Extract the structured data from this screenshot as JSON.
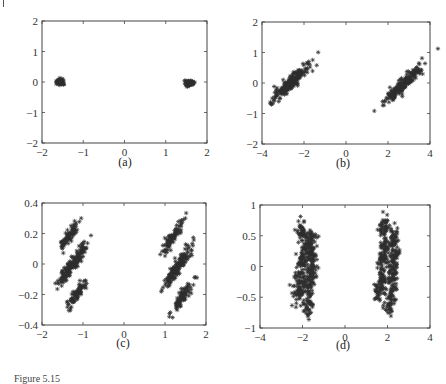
{
  "figure": {
    "caption_fragment": "Figure 5.15",
    "marker_color": "#2e2e2e",
    "panels": [
      {
        "id": "a",
        "label": "(a)",
        "frame": {
          "left": 42,
          "top": 21,
          "right": 207,
          "bottom": 143
        },
        "label_pos": {
          "x": 125,
          "y": 163
        }
      },
      {
        "id": "b",
        "label": "(b)",
        "frame": {
          "left": 262,
          "top": 22,
          "right": 430,
          "bottom": 144
        },
        "label_pos": {
          "x": 343,
          "y": 164
        }
      },
      {
        "id": "c",
        "label": "(c)",
        "frame": {
          "left": 42,
          "top": 203,
          "right": 206,
          "bottom": 325
        },
        "label_pos": {
          "x": 123,
          "y": 344
        }
      },
      {
        "id": "d",
        "label": "(d)",
        "frame": {
          "left": 260,
          "top": 205,
          "right": 430,
          "bottom": 328
        },
        "label_pos": {
          "x": 343,
          "y": 346
        }
      }
    ]
  },
  "chart_data": [
    {
      "panel": "a",
      "type": "scatter",
      "title": "",
      "xlabel": "",
      "ylabel": "",
      "xlim": [
        -2,
        2
      ],
      "ylim": [
        -2,
        2
      ],
      "xticks": [
        -2,
        -1,
        0,
        1,
        2
      ],
      "yticks": [
        -2,
        -1,
        0,
        1,
        2
      ],
      "xtick_labels": [
        "−2",
        "−1",
        "0",
        "1",
        "2"
      ],
      "ytick_labels": [
        "−2",
        "−1",
        "0",
        "1",
        "2"
      ],
      "grid": false,
      "marker": "*",
      "clusters": [
        {
          "cx": -1.55,
          "cy": 0.0,
          "sx": 0.05,
          "sy": 0.05,
          "rot": 0,
          "n": 60
        },
        {
          "cx": 1.57,
          "cy": -0.03,
          "sx": 0.06,
          "sy": 0.05,
          "rot": 0,
          "n": 60
        }
      ]
    },
    {
      "panel": "b",
      "type": "scatter",
      "title": "",
      "xlabel": "",
      "ylabel": "",
      "xlim": [
        -4,
        4
      ],
      "ylim": [
        -2,
        2
      ],
      "xticks": [
        -4,
        -2,
        0,
        2,
        4
      ],
      "yticks": [
        -2,
        -1,
        0,
        1,
        2
      ],
      "xtick_labels": [
        "−4",
        "−2",
        "0",
        "2",
        "4"
      ],
      "ytick_labels": [
        "−2",
        "−1",
        "0",
        "1",
        "2"
      ],
      "grid": false,
      "marker": "*",
      "clusters": [
        {
          "cx": -2.65,
          "cy": 0.0,
          "sx": 0.12,
          "sy": 0.4,
          "rot": 0.8,
          "n": 220
        },
        {
          "cx": 2.75,
          "cy": -0.03,
          "sx": 0.12,
          "sy": 0.4,
          "rot": 0.8,
          "n": 220
        }
      ]
    },
    {
      "panel": "c",
      "type": "scatter",
      "title": "",
      "xlabel": "",
      "ylabel": "",
      "xlim": [
        -2,
        2
      ],
      "ylim": [
        -0.4,
        0.4
      ],
      "xticks": [
        -2,
        -1,
        0,
        1,
        2
      ],
      "yticks": [
        -0.4,
        -0.2,
        0,
        0.2,
        0.4
      ],
      "xtick_labels": [
        "−2",
        "−1",
        "0",
        "1",
        "2"
      ],
      "ytick_labels": [
        "−0.4",
        "−0.2",
        "0",
        "0.2",
        "0.4"
      ],
      "grid": false,
      "marker": "*",
      "clusters": [
        {
          "cx": -1.33,
          "cy": 0.19,
          "sx": 0.05,
          "sy": 0.06,
          "rot": 0.55,
          "n": 90
        },
        {
          "cx": -1.13,
          "cy": 0.04,
          "sx": 0.05,
          "sy": 0.06,
          "rot": 0.55,
          "n": 90
        },
        {
          "cx": -1.38,
          "cy": -0.04,
          "sx": 0.05,
          "sy": 0.06,
          "rot": 0.55,
          "n": 90
        },
        {
          "cx": -1.13,
          "cy": -0.19,
          "sx": 0.05,
          "sy": 0.06,
          "rot": 0.55,
          "n": 90
        },
        {
          "cx": 1.17,
          "cy": 0.17,
          "sx": 0.05,
          "sy": 0.06,
          "rot": 0.55,
          "n": 90
        },
        {
          "cx": 1.42,
          "cy": 0.02,
          "sx": 0.05,
          "sy": 0.06,
          "rot": 0.55,
          "n": 90
        },
        {
          "cx": 1.2,
          "cy": -0.06,
          "sx": 0.05,
          "sy": 0.06,
          "rot": 0.55,
          "n": 90
        },
        {
          "cx": 1.44,
          "cy": -0.21,
          "sx": 0.05,
          "sy": 0.06,
          "rot": 0.55,
          "n": 90
        }
      ]
    },
    {
      "panel": "d",
      "type": "scatter",
      "title": "",
      "xlabel": "",
      "ylabel": "",
      "xlim": [
        -4,
        4
      ],
      "ylim": [
        -1,
        1
      ],
      "xticks": [
        -4,
        -2,
        0,
        2,
        4
      ],
      "yticks": [
        -1,
        -0.5,
        0,
        0.5,
        1
      ],
      "xtick_labels": [
        "−4",
        "−2",
        "0",
        "2",
        "4"
      ],
      "ytick_labels": [
        "−1",
        "−0.5",
        "0",
        "0.5",
        "1"
      ],
      "grid": false,
      "marker": "*",
      "clusters": [
        {
          "cx": -2.05,
          "cy": 0.6,
          "sx": 0.12,
          "sy": 0.1,
          "rot": 0,
          "n": 40
        },
        {
          "cx": -1.6,
          "cy": 0.45,
          "sx": 0.12,
          "sy": 0.1,
          "rot": 0,
          "n": 40
        },
        {
          "cx": -1.9,
          "cy": 0.3,
          "sx": 0.12,
          "sy": 0.1,
          "rot": 0,
          "n": 40
        },
        {
          "cx": -1.55,
          "cy": 0.15,
          "sx": 0.12,
          "sy": 0.1,
          "rot": 0,
          "n": 40
        },
        {
          "cx": -2.0,
          "cy": 0.05,
          "sx": 0.12,
          "sy": 0.1,
          "rot": 0,
          "n": 40
        },
        {
          "cx": -1.6,
          "cy": -0.05,
          "sx": 0.12,
          "sy": 0.1,
          "rot": 0,
          "n": 40
        },
        {
          "cx": -2.1,
          "cy": -0.2,
          "sx": 0.12,
          "sy": 0.1,
          "rot": 0,
          "n": 40
        },
        {
          "cx": -1.7,
          "cy": -0.3,
          "sx": 0.12,
          "sy": 0.1,
          "rot": 0,
          "n": 40
        },
        {
          "cx": -2.2,
          "cy": -0.45,
          "sx": 0.12,
          "sy": 0.1,
          "rot": 0,
          "n": 40
        },
        {
          "cx": -1.75,
          "cy": -0.65,
          "sx": 0.12,
          "sy": 0.1,
          "rot": 0,
          "n": 40
        },
        {
          "cx": 1.85,
          "cy": 0.65,
          "sx": 0.12,
          "sy": 0.1,
          "rot": 0,
          "n": 40
        },
        {
          "cx": 2.3,
          "cy": 0.45,
          "sx": 0.12,
          "sy": 0.1,
          "rot": 0,
          "n": 40
        },
        {
          "cx": 1.9,
          "cy": 0.35,
          "sx": 0.12,
          "sy": 0.1,
          "rot": 0,
          "n": 40
        },
        {
          "cx": 2.35,
          "cy": 0.2,
          "sx": 0.12,
          "sy": 0.1,
          "rot": 0,
          "n": 40
        },
        {
          "cx": 1.8,
          "cy": 0.1,
          "sx": 0.12,
          "sy": 0.1,
          "rot": 0,
          "n": 40
        },
        {
          "cx": 2.25,
          "cy": -0.05,
          "sx": 0.12,
          "sy": 0.1,
          "rot": 0,
          "n": 40
        },
        {
          "cx": 1.75,
          "cy": -0.2,
          "sx": 0.12,
          "sy": 0.1,
          "rot": 0,
          "n": 40
        },
        {
          "cx": 2.2,
          "cy": -0.3,
          "sx": 0.12,
          "sy": 0.1,
          "rot": 0,
          "n": 40
        },
        {
          "cx": 1.6,
          "cy": -0.4,
          "sx": 0.12,
          "sy": 0.1,
          "rot": 0,
          "n": 40
        },
        {
          "cx": 2.1,
          "cy": -0.6,
          "sx": 0.12,
          "sy": 0.1,
          "rot": 0,
          "n": 40
        }
      ]
    }
  ]
}
